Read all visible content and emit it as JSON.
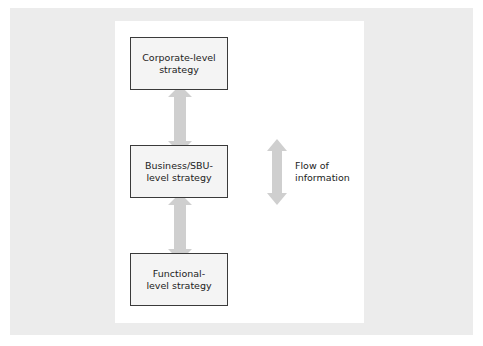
{
  "diagram": {
    "levels": [
      {
        "line1": "Corporate-level",
        "line2": "strategy"
      },
      {
        "line1": "Business/SBU-",
        "line2": "level strategy"
      },
      {
        "line1": "Functional-",
        "line2": "level strategy"
      }
    ],
    "legend": {
      "line1": "Flow of",
      "line2": "information",
      "icon": "double-headed-arrow"
    },
    "colors": {
      "arrow": "#cfcfcf",
      "box_border": "#3a3a3a",
      "backdrop": "#ececec"
    }
  }
}
